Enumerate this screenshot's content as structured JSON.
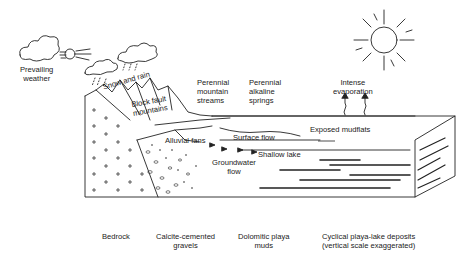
{
  "diagram": {
    "labels": {
      "prevailing_weather": [
        "Prevailing",
        "weather"
      ],
      "snow_and_rain": "Snow and rain",
      "block_fault_mountains": [
        "Block fault",
        "mountains"
      ],
      "perennial_mountain_streams": [
        "Perennial",
        "mountain",
        "streams"
      ],
      "perennial_alkaline_springs": [
        "Perennial",
        "alkaline",
        "springs"
      ],
      "intense_evaporation": [
        "Intense",
        "evaporation"
      ],
      "exposed_mudflats": "Exposed mudflats",
      "alluvial_fans": "Alluvial fans",
      "surface_flow": "Surface flow",
      "shallow_lake": "Shallow lake",
      "groundwater_flow": [
        "Groundwater",
        "flow"
      ],
      "bedrock": "Bedrock",
      "calcite_cemented_gravels": [
        "Calcite-cemented",
        "gravels"
      ],
      "dolomitic_playa_muds": [
        "Dolomitic playa",
        "muds"
      ],
      "cyclical_deposits": [
        "Cyclical playa-lake deposits",
        "(vertical scale exaggerated)"
      ]
    },
    "icons": [
      "cloud-icon",
      "wind-face-icon",
      "sun-icon",
      "evaporation-arrow-icon",
      "groundwater-arrow-icon"
    ],
    "colors": {
      "ink": "#222222",
      "background": "#ffffff"
    }
  }
}
